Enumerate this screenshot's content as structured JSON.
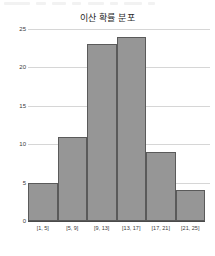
{
  "chart_data": {
    "type": "bar",
    "title": "이산 확률 분포",
    "xlabel": "",
    "ylabel": "",
    "categories": [
      "[1, 5]",
      "[5, 9]",
      "[9, 13]",
      "[13, 17]",
      "[17, 21]",
      "[21, 25]"
    ],
    "values": [
      5,
      11,
      23,
      24,
      9,
      4
    ],
    "ylim": [
      0,
      25
    ],
    "yticks": [
      0,
      5,
      10,
      15,
      20,
      25
    ],
    "ytick_labels": [
      "0",
      "5",
      "10",
      "15",
      "20",
      "25"
    ],
    "grid": true,
    "legend": false,
    "bar_gap": 0,
    "colors": {
      "bar_fill": "#969696",
      "bar_edge": "#5a5a5a",
      "gridline": "#d6d6d6",
      "axis": "#4a4a4a",
      "text": "#3a3a3a",
      "title": "#2b2b2b",
      "background": "#ffffff"
    }
  }
}
